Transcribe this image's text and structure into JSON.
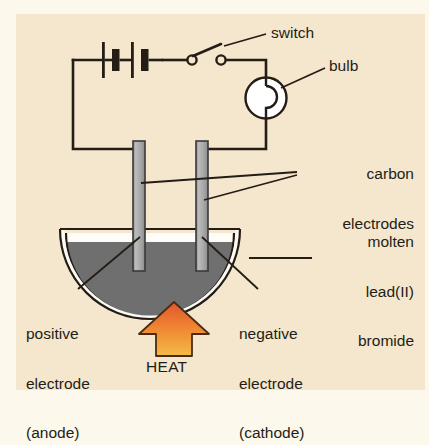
{
  "diagram": {
    "background_color": "#f4e7cd",
    "page_color": "#fdf8ec",
    "ink_color": "#241d16",
    "labels": {
      "switch": "switch",
      "bulb": "bulb",
      "carbon_electrodes": "carbon\nelectrodes",
      "carbon_electrodes_line1": "carbon",
      "carbon_electrodes_line2": "electrodes",
      "molten_lead_bromide": "molten\nlead(II)\nbromide",
      "molten_line1": "molten",
      "molten_line2": "lead(II)",
      "molten_line3": "bromide",
      "positive_electrode": "positive\nelectrode\n(anode)",
      "positive_line1": "positive",
      "positive_line2": "electrode",
      "positive_line3": "(anode)",
      "negative_electrode": "negative\nelectrode\n(cathode)",
      "negative_line1": "negative",
      "negative_line2": "electrode",
      "negative_line3": "(cathode)",
      "heat": "HEAT"
    },
    "components": {
      "battery": {
        "name": "battery",
        "cells": 2
      },
      "switch": {
        "name": "switch",
        "state": "open"
      },
      "lamp": {
        "name": "bulb"
      },
      "electrode_left": {
        "name": "positive electrode (anode)",
        "material": "carbon",
        "color": "#a9a9a9"
      },
      "electrode_right": {
        "name": "negative electrode (cathode)",
        "material": "carbon",
        "color": "#a9a9a9"
      },
      "beaker": {
        "name": "crucible",
        "contents": "molten lead(II) bromide",
        "liquid_color": "#6f6f6f"
      },
      "heat_source": {
        "name": "heat arrow",
        "color_top": "#e8642a",
        "color_bottom": "#f2b33c"
      }
    }
  }
}
